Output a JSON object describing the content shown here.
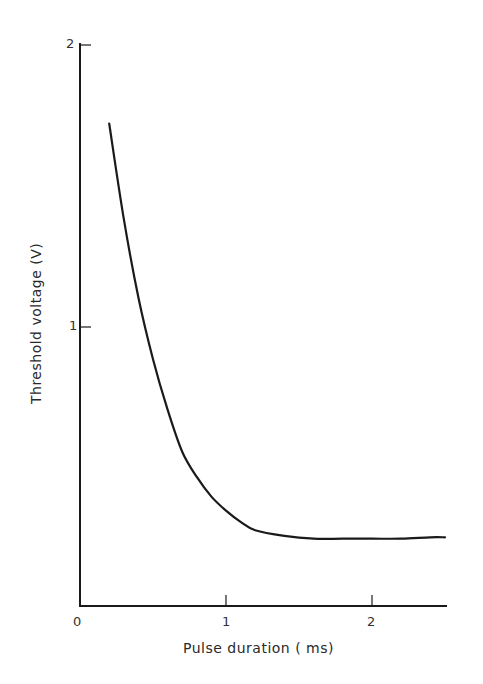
{
  "chart_data": {
    "type": "line",
    "title": "",
    "xlabel": "Pulse duration (ms)",
    "ylabel": "Threshold voltage (V)",
    "xlim": [
      0,
      2.5
    ],
    "ylim": [
      0,
      2
    ],
    "x_ticks": [
      "0",
      "1",
      "2"
    ],
    "y_ticks": [
      "1",
      "2"
    ],
    "grid": false,
    "legend": null,
    "series": [
      {
        "name": "strength-duration curve",
        "x": [
          0.2,
          0.3,
          0.4,
          0.5,
          0.6,
          0.7,
          0.8,
          0.9,
          1.0,
          1.1,
          1.2,
          1.4,
          1.6,
          1.8,
          2.0,
          2.2,
          2.4,
          2.5
        ],
        "y": [
          1.72,
          1.38,
          1.1,
          0.88,
          0.7,
          0.55,
          0.46,
          0.39,
          0.34,
          0.3,
          0.27,
          0.25,
          0.24,
          0.24,
          0.24,
          0.24,
          0.245,
          0.245
        ]
      }
    ]
  },
  "labels": {
    "x0": "0",
    "x1": "1",
    "x2": "2",
    "y1": "1",
    "y2": "2",
    "xlabel": "Pulse duration ( ms)",
    "ylabel": "Threshold voltage (V)"
  },
  "colors": {
    "line": "#1a1a1a",
    "axis": "#1a1a1a"
  }
}
